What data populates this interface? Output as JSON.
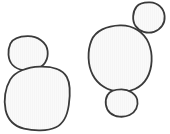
{
  "document": {
    "title": "Blob Line Drawing",
    "width": 170,
    "height": 134,
    "background_color": "#ffffff",
    "description": "Hand-drawn line art of five rounded blob outlines arranged in two clusters"
  },
  "style": {
    "stroke_color": "#3a3a3a",
    "stroke_width": 1.8,
    "fill_color": "#fafafa",
    "stripe_color": "#f2f2f2",
    "stripe_opacity": 0.55
  },
  "clusters": [
    {
      "name": "left-cluster",
      "label": "Left cluster",
      "shape_count": 2
    },
    {
      "name": "right-cluster",
      "label": "Right cluster",
      "shape_count": 3
    }
  ],
  "shapes": [
    {
      "id": "left-upper-blob",
      "name": "blob-left-upper",
      "cluster": "left-cluster",
      "label": "Left upper small blob",
      "bbox": [
        8,
        36,
        40,
        34
      ],
      "path": "M 27.5 36.2 C 37.5 36.0 46.6 42.0 47.6 51.0 C 48.6 59.8 44.0 66.6 36.0 69.2 C 28.0 71.8 18.0 70.6 12.6 65.0 C 7.6 59.8 7.4 50.0 10.4 43.6 C 13.2 38.0 19.2 36.4 27.5 36.2 Z"
    },
    {
      "id": "left-lower-blob",
      "name": "blob-left-lower",
      "cluster": "left-cluster",
      "label": "Left lower large rounded-square blob",
      "bbox": [
        5,
        66,
        65,
        64
      ],
      "path": "M 40.0 66.6 C 52.0 66.2 62.6 69.6 66.8 77.0 C 70.6 83.8 70.2 95.0 68.8 105.0 C 67.4 115.0 64.0 123.4 56.0 127.2 C 47.4 131.2 34.0 131.0 24.0 128.6 C 14.2 126.2 7.8 120.0 5.6 110.0 C 3.4 100.0 5.2 88.0 10.2 79.6 C 15.0 71.6 27.0 67.0 40.0 66.6 Z"
    },
    {
      "id": "right-main-blob",
      "name": "blob-right-main",
      "cluster": "right-cluster",
      "label": "Right large central blob",
      "bbox": [
        88,
        25,
        64,
        67
      ],
      "path": "M 120.0 25.4 C 133.0 25.0 144.0 32.0 148.6 43.0 C 153.2 54.0 152.6 68.0 147.0 78.0 C 141.4 88.0 130.0 92.6 119.0 91.8 C 108.0 91.0 98.0 85.0 92.8 75.0 C 87.6 65.0 87.2 51.0 91.4 40.6 C 95.4 30.6 107.0 25.8 120.0 25.4 Z"
    },
    {
      "id": "right-upper-blob",
      "name": "blob-right-upper",
      "cluster": "right-cluster",
      "label": "Right upper tilted oval blob",
      "bbox": [
        133,
        2,
        32,
        31
      ],
      "path": "M 150.0 2.4 C 158.0 2.6 164.0 8.4 164.6 16.0 C 165.2 23.4 161.0 29.6 154.0 31.8 C 147.2 34.0 139.4 31.6 135.6 26.0 C 131.8 20.4 132.6 11.6 136.6 6.6 C 139.8 2.6 144.4 2.2 150.0 2.4 Z"
    },
    {
      "id": "right-lower-blob",
      "name": "blob-right-lower",
      "cluster": "right-cluster",
      "label": "Right lower small oval blob",
      "bbox": [
        105,
        89,
        33,
        28
      ],
      "path": "M 121.5 89.4 C 129.0 89.4 135.6 93.4 137.2 99.6 C 138.8 105.8 135.6 112.2 129.6 115.0 C 123.6 117.8 115.0 117.2 110.2 113.0 C 105.4 108.8 104.4 100.6 107.4 95.2 C 110.0 90.6 115.0 89.4 121.5 89.4 Z"
    }
  ]
}
